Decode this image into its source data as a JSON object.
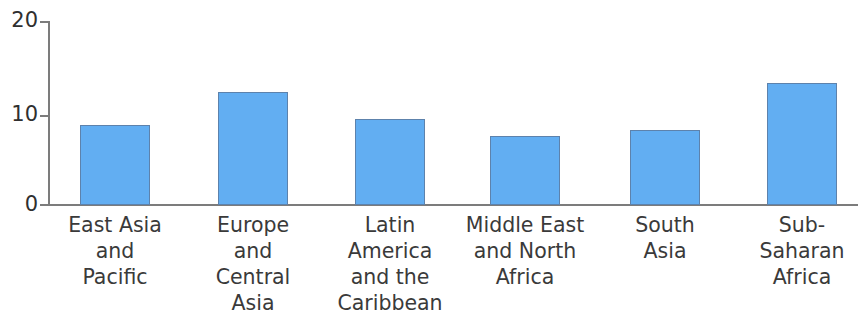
{
  "chart_data": {
    "type": "bar",
    "title": "",
    "subtitle": "",
    "xlabel": "",
    "ylabel": "",
    "ylim": [
      0,
      20
    ],
    "yticks": [
      0,
      10,
      20
    ],
    "ytick_labels": [
      "0",
      "10",
      "20"
    ],
    "grid": false,
    "legend": null,
    "legend_position": "none",
    "bar_color": "#62aef2",
    "bar_border_color": "#5d82ac",
    "axis_color": "#7c7c7c",
    "text_color": "#3a3a3a",
    "categories": [
      "East Asia\nand\nPacific",
      "Europe\nand\nCentral\nAsia",
      "Latin\nAmerica\nand the\nCaribbean",
      "Middle East\nand North\nAfrica",
      "South\nAsia",
      "Sub-\nSaharan\nAfrica"
    ],
    "values": [
      8.7,
      12.3,
      9.3,
      7.5,
      8.2,
      13.3
    ]
  },
  "axis": {
    "tick_20": "20",
    "tick_10": "10",
    "tick_0": "0"
  },
  "bars": [
    {
      "label": "East Asia\nand\nPacific",
      "value": 8.7,
      "left": 80,
      "width": 70
    },
    {
      "label": "Europe\nand\nCentral\nAsia",
      "value": 12.3,
      "left": 218,
      "width": 70
    },
    {
      "label": "Latin\nAmerica\nand the\nCaribbean",
      "value": 9.3,
      "left": 355,
      "width": 70
    },
    {
      "label": "Middle East\nand North\nAfrica",
      "value": 7.5,
      "left": 490,
      "width": 70
    },
    {
      "label": "South\nAsia",
      "value": 8.2,
      "left": 630,
      "width": 70
    },
    {
      "label": "Sub-\nSaharan\nAfrica",
      "value": 13.3,
      "left": 767,
      "width": 70
    }
  ]
}
